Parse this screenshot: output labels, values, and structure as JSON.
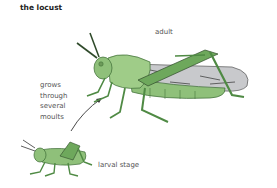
{
  "diagram": {
    "title": "the locust",
    "labels": {
      "adult": "adult",
      "moult_line1": "grows",
      "moult_line2": "through",
      "moult_line3": "several",
      "moult_line4": "moults",
      "larva": "larval stage"
    },
    "colors": {
      "body_green": "#8fc07a",
      "dark_green": "#4f8a44",
      "wing_grey": "#c8c9cc",
      "outline": "#2f4a2a",
      "text": "#555555"
    }
  }
}
